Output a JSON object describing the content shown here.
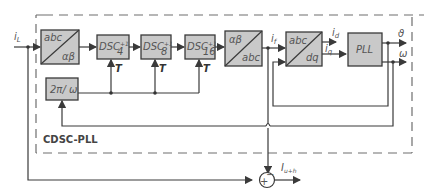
{
  "diagram": {
    "frame_label": "CDSC-PLL",
    "input_label": "i",
    "input_sub": "L",
    "blocks": {
      "abc_ab": {
        "top": "abc",
        "bottom": "αβ"
      },
      "dsc1": {
        "main": "DSC",
        "sup": "+1",
        "sub": "4"
      },
      "dsc2": {
        "main": "DSC",
        "sup": "+1",
        "sub": "8"
      },
      "dsc3": {
        "main": "DSC",
        "sup": "+1",
        "sub": "16"
      },
      "ab_abc": {
        "top": "αβ",
        "bottom": "abc"
      },
      "abc_dq": {
        "top": "abc",
        "bottom": "dq"
      },
      "pll": "PLL",
      "period": "2π/ ω"
    },
    "signals": {
      "T": "T",
      "i_f": "i",
      "i_f_sub": "f",
      "i_d": "i",
      "i_d_sub": "d",
      "i_q": "i",
      "i_q_sub": "q",
      "theta": "ϑ",
      "omega": "ω",
      "output": "I",
      "output_sub": "u+h"
    },
    "summer": {
      "plus": "+",
      "minus": "−"
    }
  }
}
